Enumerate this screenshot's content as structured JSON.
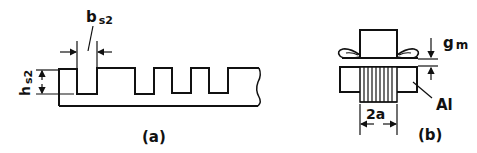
{
  "figure_a": {
    "caption": "(a)",
    "slot_width_label": {
      "main": "b",
      "sub": "s2"
    },
    "slot_height_label": {
      "main": "h",
      "sub": "s2"
    }
  },
  "figure_b": {
    "caption": "(b)",
    "gap_label": {
      "main": "g",
      "sub": "m"
    },
    "width_label": "2a",
    "material_label": "Al"
  },
  "colors": {
    "stroke": "#111111",
    "background": "#ffffff"
  }
}
